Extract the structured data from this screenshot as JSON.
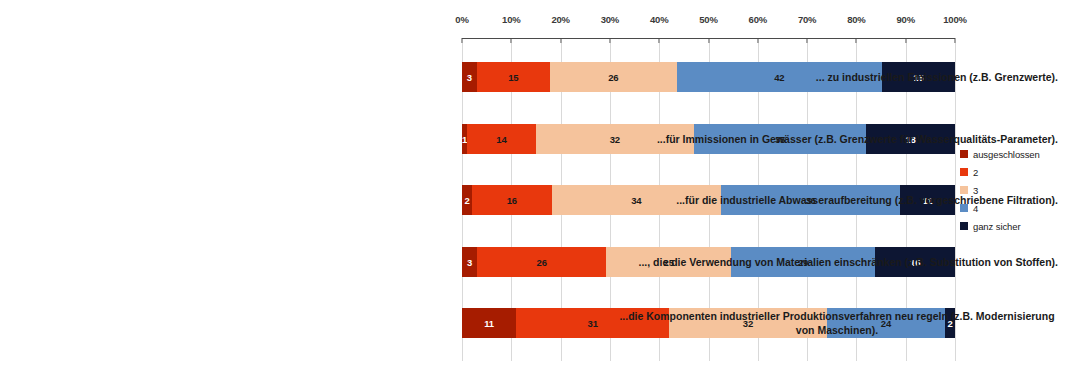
{
  "chart_data": {
    "type": "bar",
    "orientation": "horizontal",
    "stacked": true,
    "normalized_percent": true,
    "title": "",
    "subtitle": "",
    "xlabel": "",
    "ylabel": "",
    "xlim": [
      0,
      100
    ],
    "grid": true,
    "axis_position": "top",
    "legend_position": "right",
    "tick_labels": [
      "0%",
      "10%",
      "20%",
      "30%",
      "40%",
      "50%",
      "60%",
      "70%",
      "80%",
      "90%",
      "100%"
    ],
    "tick_values": [
      0,
      10,
      20,
      30,
      40,
      50,
      60,
      70,
      80,
      90,
      100
    ],
    "categories": [
      "... zu industriellen Emissionen (z.B. Grenzwerte).",
      "...für Immissionen in Gewässer (z.B. Grenzwerte für Wasserqualitäts-Parameter).",
      "...für die industrielle Abwasseraufbereitung (z.B. vorgeschriebene Filtration).",
      "..., die die Verwendung von Materialien einschränken (z.B. Substitution von Stoffen).",
      "...die Komponenten industrieller Produktionsverfahren neu regeln (z.B. Modernisierung von Maschinen)."
    ],
    "series": [
      {
        "name": "ausgeschlossen",
        "color": "#A61C00",
        "values": [
          3,
          1,
          2,
          3,
          11
        ]
      },
      {
        "name": "2",
        "color": "#E8380D",
        "values": [
          15,
          14,
          16,
          26,
          31
        ]
      },
      {
        "name": "3",
        "color": "#F5C39C",
        "values": [
          26,
          32,
          34,
          25,
          32
        ]
      },
      {
        "name": "4",
        "color": "#5B8CC4",
        "values": [
          42,
          35,
          36,
          29,
          24
        ]
      },
      {
        "name": "ganz sicher",
        "color": "#0D1633",
        "values": [
          15,
          18,
          11,
          16,
          2
        ]
      }
    ],
    "label_text_colors": [
      "#ffffff",
      "#1a1a1a",
      "#1a1a1a",
      "#1a1a1a",
      "#ffffff"
    ]
  },
  "legend": {
    "items": [
      {
        "label": "ausgeschlossen",
        "color": "#A61C00"
      },
      {
        "label": "2",
        "color": "#E8380D"
      },
      {
        "label": "3",
        "color": "#F5C39C"
      },
      {
        "label": "4",
        "color": "#5B8CC4"
      },
      {
        "label": "ganz sicher",
        "color": "#0D1633"
      }
    ]
  }
}
